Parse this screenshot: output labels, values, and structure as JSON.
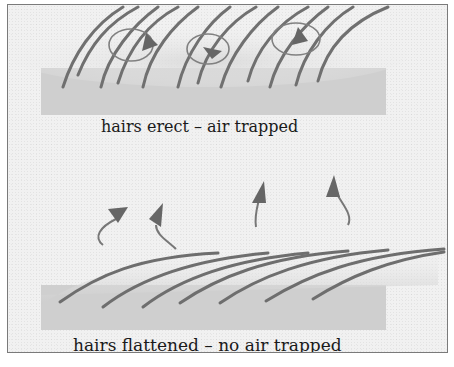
{
  "diagram": {
    "panels": [
      {
        "id": "erect",
        "caption": "hairs erect – air trapped",
        "hair_state": "erect",
        "air_trapped": true
      },
      {
        "id": "flattened",
        "caption": "hairs flattened – no air trapped",
        "hair_state": "flattened",
        "air_trapped": false
      }
    ],
    "colors": {
      "background": "#f1f1f1",
      "skin": "#cfcfcf",
      "hair": "#6e6e6e",
      "arrow": "#6a6a6a",
      "border": "#7a7a7a",
      "text": "#1a1a1a"
    }
  }
}
